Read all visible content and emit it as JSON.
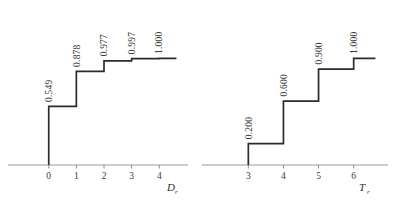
{
  "figure": {
    "background_color": "#ffffff",
    "line_color": "#2b2b2b",
    "axis_color": "#9a9a9a",
    "text_color": "#3a3a3a"
  },
  "chart_data": [
    {
      "type": "line",
      "subtype": "empirical-cdf-step",
      "panel": "left",
      "title": "",
      "xlabel": "D",
      "xlabel_subscript": "r",
      "ylabel": "",
      "grid": false,
      "legend": null,
      "xlim": [
        -0.75,
        4.75
      ],
      "ylim": [
        0,
        1.06
      ],
      "xticks": [
        0,
        1,
        2,
        3,
        4
      ],
      "xticklabels": [
        "0",
        "1",
        "2",
        "3",
        "4"
      ],
      "x": [
        0,
        1,
        2,
        3,
        4
      ],
      "values": [
        0.549,
        0.878,
        0.977,
        0.997,
        1.0
      ],
      "point_labels": [
        "0.549",
        "0.878",
        "0.977",
        "0.997",
        "1.000"
      ],
      "label_rotation": -90,
      "baseline_value": 0.0
    },
    {
      "type": "line",
      "subtype": "empirical-cdf-step",
      "panel": "right",
      "title": "",
      "xlabel": "T",
      "xlabel_subscript": "r",
      "ylabel": "",
      "grid": false,
      "legend": null,
      "xlim": [
        2.25,
        6.75
      ],
      "ylim": [
        0,
        1.06
      ],
      "xticks": [
        3,
        4,
        5,
        6
      ],
      "xticklabels": [
        "3",
        "4",
        "5",
        "6"
      ],
      "x": [
        3,
        4,
        5,
        6
      ],
      "values": [
        0.2,
        0.6,
        0.9,
        1.0
      ],
      "point_labels": [
        "0.200",
        "0.600",
        "0.900",
        "1.000"
      ],
      "label_rotation": -90,
      "baseline_value": 0.0
    }
  ]
}
